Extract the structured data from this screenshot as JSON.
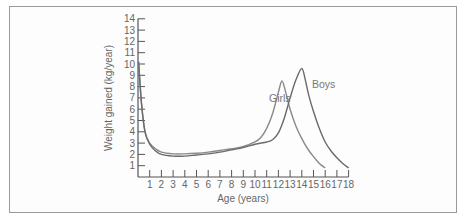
{
  "chart_data": {
    "type": "line",
    "title": "",
    "xlabel": "Age (years)",
    "ylabel": "Weight gained (kg/year)",
    "xlim": [
      0,
      18
    ],
    "ylim": [
      0,
      14
    ],
    "x_ticks": [
      1,
      2,
      3,
      4,
      5,
      6,
      7,
      8,
      9,
      10,
      11,
      12,
      13,
      14,
      15,
      16,
      17,
      18
    ],
    "y_ticks": [
      1,
      2,
      3,
      4,
      5,
      6,
      7,
      8,
      9,
      10,
      11,
      12,
      13,
      14
    ],
    "grid": false,
    "legend": "inline labels",
    "series": [
      {
        "name": "Girls",
        "color": "#8a8a8a",
        "x": [
          0.05,
          0.3,
          0.6,
          1,
          1.5,
          2,
          3,
          4,
          5,
          6,
          7,
          8,
          9,
          10,
          10.5,
          11,
          11.5,
          12,
          12.3,
          12.6,
          13,
          13.5,
          14,
          14.5,
          15,
          15.5,
          16
        ],
        "y": [
          10.2,
          6.5,
          4.0,
          3.0,
          2.5,
          2.2,
          2.05,
          2.05,
          2.1,
          2.2,
          2.35,
          2.5,
          2.7,
          3.1,
          3.5,
          4.3,
          5.6,
          7.5,
          8.5,
          7.6,
          6.0,
          4.5,
          3.4,
          2.5,
          1.8,
          1.2,
          0.8
        ]
      },
      {
        "name": "Boys",
        "color": "#6a6a6a",
        "x": [
          0.05,
          0.3,
          0.6,
          1,
          1.5,
          2,
          3,
          4,
          5,
          6,
          7,
          8,
          9,
          10,
          11,
          11.5,
          12,
          12.5,
          13,
          13.5,
          14,
          14.3,
          14.6,
          15,
          15.5,
          16,
          16.5,
          17,
          17.5,
          18
        ],
        "y": [
          10.2,
          6.5,
          4.0,
          2.9,
          2.3,
          2.0,
          1.85,
          1.85,
          1.95,
          2.05,
          2.2,
          2.4,
          2.6,
          2.9,
          3.1,
          3.3,
          3.9,
          5.2,
          7.0,
          8.6,
          9.6,
          8.6,
          7.2,
          5.8,
          4.3,
          3.1,
          2.3,
          1.7,
          1.2,
          0.8
        ]
      }
    ],
    "annotations": [
      {
        "text": "Girls",
        "x": 11.3,
        "y": 6.0
      },
      {
        "text": "Boys",
        "x": 15.1,
        "y": 7.6
      }
    ]
  },
  "labels": {
    "xlabel": "Age (years)",
    "ylabel": "Weight gained (kg/year)",
    "girls": "Girls",
    "boys": "Boys"
  }
}
